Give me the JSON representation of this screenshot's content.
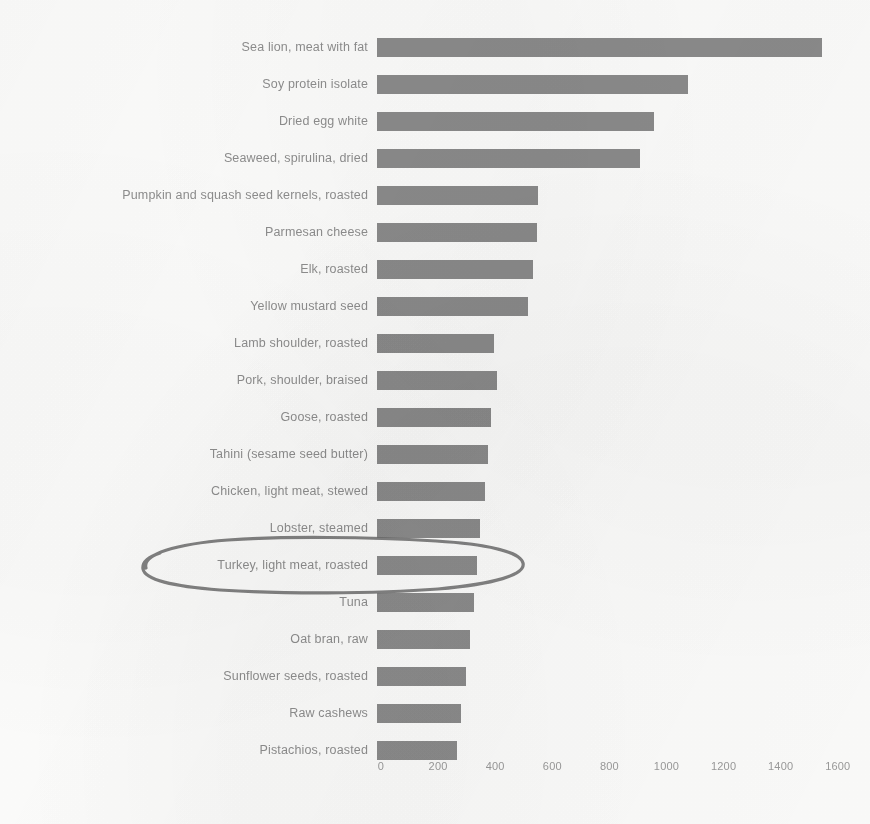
{
  "chart_data": {
    "type": "bar",
    "orientation": "horizontal",
    "title": "",
    "subtitle": "",
    "xlabel": "",
    "ylabel": "",
    "xlim": [
      0,
      1600
    ],
    "xticks": [
      0,
      200,
      400,
      600,
      800,
      1000,
      1200,
      1400,
      1600
    ],
    "xtick_labels": [
      "0",
      "200",
      "400",
      "600",
      "800",
      "1000",
      "1200",
      "1400",
      "1600"
    ],
    "grid": false,
    "legend": null,
    "bar_color": "#8b8b8b",
    "categories": [
      "Sea lion, meat with fat",
      "Soy protein isolate",
      "Dried egg white",
      "Seaweed, spirulina, dried",
      "Pumpkin and squash seed kernels, roasted",
      "Parmesan cheese",
      "Elk, roasted",
      "Yellow mustard seed",
      "Lamb shoulder, roasted",
      "Pork, shoulder, braised",
      "Goose, roasted",
      "Tahini (sesame seed butter)",
      "Chicken, light meat, stewed",
      "Lobster, steamed",
      "Turkey, light meat, roasted",
      "Tuna",
      "Oat bran, raw",
      "Sunflower seeds, roasted",
      "Raw cashews",
      "Pistachios, roasted"
    ],
    "values": [
      1560,
      1090,
      970,
      920,
      565,
      560,
      545,
      530,
      410,
      420,
      400,
      390,
      380,
      360,
      350,
      340,
      325,
      312,
      295,
      280
    ],
    "annotations": [
      {
        "type": "hand-drawn-ellipse",
        "target_category": "Turkey, light meat, roasted",
        "color": "#6d6d6d"
      }
    ]
  }
}
